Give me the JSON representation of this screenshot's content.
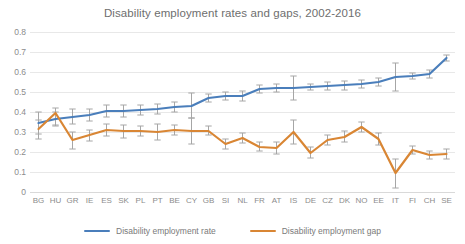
{
  "chart_data": {
    "type": "line",
    "title": "Disability employment rates and gaps, 2002-2016",
    "xlabel": "",
    "ylabel": "",
    "ylim": [
      0,
      0.8
    ],
    "yticks": [
      "0",
      "0.1",
      "0.2",
      "0.3",
      "0.4",
      "0.5",
      "0.6",
      "0.7",
      "0.8"
    ],
    "grid": true,
    "legend_position": "bottom",
    "error_bars": true,
    "categories": [
      "BG",
      "HU",
      "GR",
      "IE",
      "ES",
      "SK",
      "PL",
      "PT",
      "BE",
      "CY",
      "GB",
      "SI",
      "NL",
      "FR",
      "AT",
      "IS",
      "DE",
      "CZ",
      "DK",
      "NO",
      "EE",
      "IT",
      "FI",
      "CH",
      "SE"
    ],
    "series": [
      {
        "name": "Disability employment rate",
        "color": "#4a7ebb",
        "values": [
          0.345,
          0.365,
          0.375,
          0.385,
          0.405,
          0.405,
          0.41,
          0.415,
          0.425,
          0.43,
          0.47,
          0.48,
          0.48,
          0.515,
          0.52,
          0.52,
          0.525,
          0.53,
          0.535,
          0.54,
          0.55,
          0.575,
          0.58,
          0.59,
          0.67
        ],
        "err_low": [
          0.29,
          0.33,
          0.34,
          0.355,
          0.375,
          0.375,
          0.385,
          0.39,
          0.4,
          0.37,
          0.45,
          0.46,
          0.455,
          0.495,
          0.5,
          0.46,
          0.51,
          0.51,
          0.51,
          0.52,
          0.53,
          0.505,
          0.565,
          0.57,
          0.655
        ],
        "err_high": [
          0.4,
          0.4,
          0.415,
          0.415,
          0.435,
          0.435,
          0.435,
          0.44,
          0.45,
          0.495,
          0.49,
          0.5,
          0.505,
          0.535,
          0.54,
          0.58,
          0.54,
          0.55,
          0.555,
          0.56,
          0.57,
          0.645,
          0.595,
          0.61,
          0.685
        ]
      },
      {
        "name": "Disability employment gap",
        "color": "#d98634",
        "values": [
          0.315,
          0.395,
          0.26,
          0.285,
          0.31,
          0.305,
          0.305,
          0.3,
          0.31,
          0.305,
          0.305,
          0.24,
          0.27,
          0.225,
          0.22,
          0.3,
          0.195,
          0.26,
          0.275,
          0.325,
          0.265,
          0.095,
          0.21,
          0.185,
          0.19
        ],
        "err_low": [
          0.265,
          0.335,
          0.215,
          0.255,
          0.28,
          0.27,
          0.28,
          0.26,
          0.285,
          0.24,
          0.285,
          0.215,
          0.245,
          0.205,
          0.19,
          0.24,
          0.17,
          0.235,
          0.25,
          0.3,
          0.235,
          0.02,
          0.19,
          0.165,
          0.165
        ],
        "err_high": [
          0.36,
          0.42,
          0.3,
          0.31,
          0.34,
          0.335,
          0.33,
          0.34,
          0.335,
          0.37,
          0.33,
          0.265,
          0.295,
          0.25,
          0.25,
          0.36,
          0.225,
          0.285,
          0.305,
          0.35,
          0.295,
          0.165,
          0.23,
          0.205,
          0.215
        ]
      }
    ]
  },
  "legend": {
    "items": [
      {
        "label": "Disability employment rate",
        "color": "#4a7ebb"
      },
      {
        "label": "Disability employment gap",
        "color": "#d98634"
      }
    ]
  },
  "colors": {
    "rate": "#4a7ebb",
    "gap": "#d98634",
    "grid": "#e8e8e8",
    "text": "#8c8c8c",
    "title": "#6e6e6e",
    "errorbar": "#a6a6a6"
  }
}
